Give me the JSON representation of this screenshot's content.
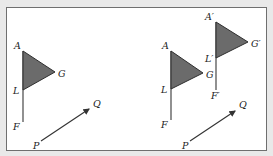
{
  "figure": {
    "colors": {
      "flag_fill": "#6b6b6b",
      "stroke": "#333333",
      "frame": "#6f6f6f",
      "background": "#ffffff"
    },
    "left_panel": {
      "labels": {
        "A": "A",
        "G": "G",
        "L": "L",
        "F": "F",
        "P": "P",
        "Q": "Q"
      }
    },
    "right_panel": {
      "original_labels": {
        "A": "A",
        "G": "G",
        "L": "L",
        "F": "F"
      },
      "image_labels": {
        "A": "A′",
        "G": "G′",
        "L": "L′",
        "F": "F′"
      },
      "vector_labels": {
        "P": "P",
        "Q": "Q"
      }
    }
  }
}
